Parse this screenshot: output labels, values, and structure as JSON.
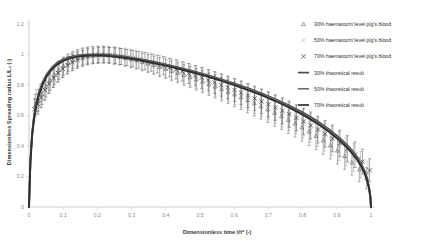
{
  "chart_data": {
    "type": "scatter",
    "title": "",
    "xlabel": "Dimensionless time t/t* (-)",
    "ylabel": "Dimensionless Spreading radius L/L₀ (-)",
    "xlim": [
      0,
      1
    ],
    "ylim": [
      0,
      1.2
    ],
    "xticks": [
      "0",
      "0.1",
      "0.2",
      "0.3",
      "0.4",
      "0.5",
      "0.6",
      "0.7",
      "0.8",
      "0.9",
      "1"
    ],
    "xtick_values": [
      0,
      0.1,
      0.2,
      0.3,
      0.4,
      0.5,
      0.6,
      0.7,
      0.8,
      0.9,
      1
    ],
    "yticks": [
      "0",
      "0.2",
      "0.4",
      "0.6",
      "0.8",
      "1",
      "1.2"
    ],
    "ytick_values": [
      0,
      0.2,
      0.4,
      0.6,
      0.8,
      1,
      1.2
    ],
    "grid": false,
    "legend_position": "upper-right-outside",
    "legend": [
      {
        "label": "30% haematocrit level pig's blood",
        "marker": "triangle",
        "color": "#555555"
      },
      {
        "label": "50% haematocrit level pig's blood",
        "marker": "x-thin",
        "color": "#8d8d8d"
      },
      {
        "label": "70% haematocrit level pig's blood",
        "marker": "x-bold",
        "color": "#3d3d3d"
      },
      {
        "label": "30% theoretical result",
        "marker": "line",
        "color": "#4a4a4a"
      },
      {
        "label": "50% theoretical result",
        "marker": "line",
        "color": "#707070"
      },
      {
        "label": "70% theoretical result",
        "marker": "line",
        "color": "#2f2f2f"
      }
    ],
    "series": [
      {
        "name": "30% haematocrit level pig's blood",
        "marker": "triangle",
        "color": "#555555",
        "x": [
          0.018,
          0.028,
          0.038,
          0.05,
          0.062,
          0.075,
          0.088,
          0.101,
          0.115,
          0.129,
          0.143,
          0.158,
          0.172,
          0.187,
          0.202,
          0.218,
          0.233,
          0.249,
          0.265,
          0.281,
          0.298,
          0.314,
          0.331,
          0.348,
          0.365,
          0.382,
          0.4,
          0.417,
          0.435,
          0.453,
          0.471,
          0.489,
          0.507,
          0.526,
          0.544,
          0.563,
          0.582,
          0.601,
          0.62,
          0.639,
          0.659,
          0.678,
          0.698,
          0.718,
          0.738,
          0.758,
          0.778,
          0.798,
          0.819,
          0.839,
          0.86,
          0.881,
          0.902,
          0.923,
          0.944,
          0.966,
          0.987
        ],
        "y": [
          0.665,
          0.7,
          0.742,
          0.79,
          0.83,
          0.866,
          0.898,
          0.924,
          0.946,
          0.964,
          0.978,
          0.988,
          0.995,
          0.999,
          1.0,
          0.999,
          0.996,
          0.991,
          0.985,
          0.978,
          0.97,
          0.961,
          0.951,
          0.941,
          0.93,
          0.918,
          0.906,
          0.893,
          0.88,
          0.866,
          0.852,
          0.837,
          0.822,
          0.806,
          0.79,
          0.773,
          0.756,
          0.738,
          0.72,
          0.701,
          0.681,
          0.661,
          0.64,
          0.618,
          0.596,
          0.572,
          0.548,
          0.522,
          0.495,
          0.467,
          0.437,
          0.405,
          0.371,
          0.334,
          0.293,
          0.246,
          0.188
        ],
        "yerr": [
          0.075,
          0.072,
          0.07,
          0.068,
          0.066,
          0.064,
          0.062,
          0.06,
          0.058,
          0.057,
          0.056,
          0.055,
          0.054,
          0.054,
          0.053,
          0.053,
          0.053,
          0.054,
          0.054,
          0.055,
          0.056,
          0.057,
          0.058,
          0.059,
          0.06,
          0.062,
          0.063,
          0.065,
          0.066,
          0.068,
          0.069,
          0.071,
          0.072,
          0.074,
          0.075,
          0.077,
          0.078,
          0.08,
          0.081,
          0.082,
          0.084,
          0.085,
          0.086,
          0.087,
          0.088,
          0.089,
          0.09,
          0.09,
          0.091,
          0.091,
          0.091,
          0.09,
          0.089,
          0.087,
          0.084,
          0.079,
          0.07
        ]
      },
      {
        "name": "50% haematocrit level pig's blood",
        "marker": "x-thin",
        "color": "#8d8d8d",
        "x": [
          0.021,
          0.032,
          0.044,
          0.057,
          0.07,
          0.083,
          0.097,
          0.111,
          0.125,
          0.14,
          0.155,
          0.17,
          0.185,
          0.2,
          0.216,
          0.232,
          0.248,
          0.264,
          0.28,
          0.297,
          0.313,
          0.33,
          0.347,
          0.364,
          0.382,
          0.399,
          0.417,
          0.435,
          0.453,
          0.471,
          0.489,
          0.508,
          0.526,
          0.545,
          0.564,
          0.583,
          0.602,
          0.621,
          0.641,
          0.66,
          0.68,
          0.7,
          0.72,
          0.74,
          0.76,
          0.781,
          0.801,
          0.822,
          0.843,
          0.864,
          0.885,
          0.906,
          0.927,
          0.949,
          0.97,
          0.991
        ],
        "y": [
          0.69,
          0.728,
          0.772,
          0.815,
          0.852,
          0.884,
          0.912,
          0.935,
          0.954,
          0.969,
          0.981,
          0.989,
          0.995,
          0.998,
          0.999,
          0.998,
          0.995,
          0.99,
          0.984,
          0.977,
          0.969,
          0.96,
          0.95,
          0.94,
          0.929,
          0.917,
          0.905,
          0.892,
          0.879,
          0.865,
          0.851,
          0.836,
          0.821,
          0.805,
          0.789,
          0.772,
          0.755,
          0.737,
          0.719,
          0.7,
          0.68,
          0.66,
          0.639,
          0.617,
          0.595,
          0.571,
          0.546,
          0.52,
          0.493,
          0.464,
          0.433,
          0.4,
          0.364,
          0.324,
          0.278,
          0.22
        ],
        "yerr": [
          0.08,
          0.077,
          0.074,
          0.071,
          0.069,
          0.067,
          0.065,
          0.063,
          0.061,
          0.06,
          0.059,
          0.058,
          0.057,
          0.057,
          0.056,
          0.056,
          0.057,
          0.057,
          0.058,
          0.059,
          0.06,
          0.061,
          0.062,
          0.063,
          0.065,
          0.066,
          0.068,
          0.069,
          0.071,
          0.072,
          0.074,
          0.076,
          0.077,
          0.079,
          0.08,
          0.082,
          0.083,
          0.085,
          0.086,
          0.087,
          0.089,
          0.09,
          0.091,
          0.092,
          0.093,
          0.094,
          0.095,
          0.095,
          0.096,
          0.096,
          0.096,
          0.095,
          0.094,
          0.091,
          0.087,
          0.08
        ]
      },
      {
        "name": "70% haematocrit level pig's blood",
        "marker": "x-bold",
        "color": "#3d3d3d",
        "x": [
          0.016,
          0.026,
          0.036,
          0.047,
          0.059,
          0.072,
          0.085,
          0.099,
          0.113,
          0.127,
          0.142,
          0.157,
          0.172,
          0.188,
          0.204,
          0.22,
          0.236,
          0.253,
          0.27,
          0.287,
          0.304,
          0.321,
          0.339,
          0.357,
          0.375,
          0.393,
          0.411,
          0.43,
          0.448,
          0.467,
          0.486,
          0.505,
          0.524,
          0.543,
          0.562,
          0.581,
          0.601,
          0.62,
          0.64,
          0.66,
          0.68,
          0.7,
          0.72,
          0.741,
          0.761,
          0.782,
          0.803,
          0.824,
          0.845,
          0.866,
          0.888,
          0.909,
          0.931,
          0.953,
          0.975,
          0.996
        ],
        "y": [
          0.64,
          0.676,
          0.718,
          0.766,
          0.808,
          0.845,
          0.878,
          0.906,
          0.929,
          0.949,
          0.964,
          0.976,
          0.985,
          0.991,
          0.995,
          0.996,
          0.995,
          0.992,
          0.987,
          0.981,
          0.974,
          0.966,
          0.957,
          0.947,
          0.937,
          0.926,
          0.914,
          0.902,
          0.889,
          0.875,
          0.861,
          0.847,
          0.832,
          0.816,
          0.8,
          0.784,
          0.767,
          0.749,
          0.731,
          0.712,
          0.693,
          0.673,
          0.652,
          0.631,
          0.609,
          0.585,
          0.561,
          0.535,
          0.508,
          0.48,
          0.45,
          0.417,
          0.382,
          0.343,
          0.298,
          0.241
        ],
        "yerr": [
          0.07,
          0.068,
          0.066,
          0.064,
          0.062,
          0.06,
          0.058,
          0.057,
          0.055,
          0.054,
          0.053,
          0.052,
          0.052,
          0.051,
          0.051,
          0.051,
          0.051,
          0.052,
          0.052,
          0.053,
          0.054,
          0.055,
          0.056,
          0.057,
          0.058,
          0.06,
          0.061,
          0.063,
          0.064,
          0.066,
          0.067,
          0.069,
          0.07,
          0.072,
          0.073,
          0.075,
          0.076,
          0.078,
          0.079,
          0.08,
          0.081,
          0.083,
          0.084,
          0.085,
          0.086,
          0.086,
          0.087,
          0.088,
          0.088,
          0.088,
          0.088,
          0.087,
          0.086,
          0.084,
          0.081,
          0.075
        ]
      }
    ],
    "theoretical_curves": [
      {
        "name": "30% theoretical result",
        "color": "#4a4a4a",
        "width": 1.9,
        "x": [
          0.0,
          0.004,
          0.009,
          0.015,
          0.022,
          0.03,
          0.04,
          0.052,
          0.066,
          0.082,
          0.1,
          0.12,
          0.142,
          0.165,
          0.19,
          0.215,
          0.245,
          0.28,
          0.32,
          0.36,
          0.4,
          0.44,
          0.48,
          0.52,
          0.56,
          0.6,
          0.64,
          0.68,
          0.72,
          0.76,
          0.8,
          0.84,
          0.88,
          0.91,
          0.935,
          0.955,
          0.97,
          0.98,
          0.988,
          0.994,
          0.998,
          1.0
        ],
        "y": [
          0.0,
          0.3,
          0.48,
          0.6,
          0.688,
          0.757,
          0.818,
          0.87,
          0.913,
          0.945,
          0.968,
          0.984,
          0.994,
          0.999,
          1.0,
          0.999,
          0.994,
          0.985,
          0.971,
          0.954,
          0.935,
          0.914,
          0.891,
          0.866,
          0.839,
          0.81,
          0.779,
          0.745,
          0.708,
          0.667,
          0.621,
          0.568,
          0.505,
          0.45,
          0.396,
          0.342,
          0.288,
          0.244,
          0.192,
          0.135,
          0.072,
          0.0
        ]
      },
      {
        "name": "50% theoretical result",
        "color": "#707070",
        "width": 1.9,
        "x": [
          0.0,
          0.004,
          0.009,
          0.015,
          0.022,
          0.03,
          0.04,
          0.052,
          0.066,
          0.082,
          0.1,
          0.12,
          0.142,
          0.165,
          0.19,
          0.215,
          0.245,
          0.28,
          0.32,
          0.36,
          0.4,
          0.44,
          0.48,
          0.52,
          0.56,
          0.6,
          0.64,
          0.68,
          0.72,
          0.76,
          0.8,
          0.84,
          0.88,
          0.91,
          0.935,
          0.955,
          0.97,
          0.98,
          0.988,
          0.994,
          0.998,
          1.0
        ],
        "y": [
          0.0,
          0.294,
          0.472,
          0.592,
          0.68,
          0.75,
          0.811,
          0.864,
          0.907,
          0.94,
          0.963,
          0.98,
          0.99,
          0.996,
          0.997,
          0.996,
          0.991,
          0.982,
          0.967,
          0.95,
          0.931,
          0.91,
          0.886,
          0.861,
          0.834,
          0.805,
          0.773,
          0.739,
          0.702,
          0.66,
          0.613,
          0.56,
          0.497,
          0.441,
          0.387,
          0.333,
          0.28,
          0.236,
          0.185,
          0.13,
          0.069,
          0.0
        ]
      },
      {
        "name": "70% theoretical result",
        "color": "#2f2f2f",
        "width": 1.9,
        "x": [
          0.0,
          0.004,
          0.009,
          0.015,
          0.022,
          0.03,
          0.04,
          0.052,
          0.066,
          0.082,
          0.1,
          0.12,
          0.142,
          0.165,
          0.19,
          0.215,
          0.245,
          0.28,
          0.32,
          0.36,
          0.4,
          0.44,
          0.48,
          0.52,
          0.56,
          0.6,
          0.64,
          0.68,
          0.72,
          0.76,
          0.8,
          0.84,
          0.88,
          0.91,
          0.935,
          0.955,
          0.97,
          0.98,
          0.988,
          0.994,
          0.998,
          1.0
        ],
        "y": [
          0.0,
          0.288,
          0.464,
          0.584,
          0.672,
          0.742,
          0.804,
          0.857,
          0.901,
          0.934,
          0.958,
          0.975,
          0.986,
          0.992,
          0.994,
          0.993,
          0.988,
          0.979,
          0.964,
          0.946,
          0.927,
          0.905,
          0.882,
          0.856,
          0.829,
          0.799,
          0.767,
          0.733,
          0.695,
          0.653,
          0.606,
          0.552,
          0.489,
          0.433,
          0.378,
          0.324,
          0.272,
          0.228,
          0.178,
          0.124,
          0.066,
          0.0
        ]
      }
    ]
  }
}
